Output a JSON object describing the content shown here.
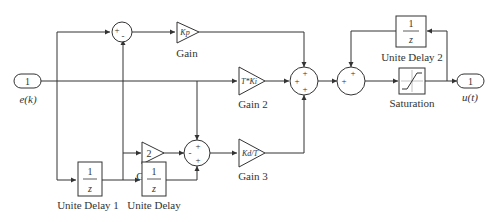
{
  "diagram": {
    "type": "block-diagram",
    "inport": {
      "number": "1",
      "label": "e(k)"
    },
    "outport": {
      "number": "1",
      "label": "u(t)"
    },
    "blocks": {
      "gain": {
        "expr": "Kp",
        "label": "Gain"
      },
      "gain1": {
        "expr": "2",
        "label": "Gain 1"
      },
      "gain2": {
        "expr": "T*Ki",
        "label": "Gain 2"
      },
      "gain3": {
        "expr": "Kd/T",
        "label": "Gain 3"
      },
      "delay": {
        "num": "1",
        "den": "z",
        "label": "Unite Delay"
      },
      "delay1": {
        "num": "1",
        "den": "z",
        "label": "Unite Delay 1"
      },
      "delay2": {
        "num": "1",
        "den": "z",
        "label": "Unite Delay 2"
      },
      "saturation": {
        "label": "Saturation"
      }
    },
    "sums": {
      "sum_top": {
        "signs": [
          "+",
          "-"
        ]
      },
      "sum_mid": {
        "signs": [
          "+",
          "-",
          "+"
        ]
      },
      "sum_main": {
        "signs": [
          "+",
          "+",
          "+"
        ]
      },
      "sum_out": {
        "signs": [
          "+",
          "+"
        ]
      }
    }
  }
}
